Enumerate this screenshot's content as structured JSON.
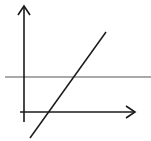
{
  "diagram": {
    "title": "",
    "colors": {
      "background": "#ffffff",
      "axes": "#1a1a1a",
      "horizontal_line": "#555555",
      "diagonal_line": "#1a1a1a"
    },
    "elements": {
      "y_axis": {
        "x": 24,
        "y1": 122,
        "y2": 6,
        "arrow": "up"
      },
      "x_axis": {
        "y": 112,
        "x1": 20,
        "x2": 135,
        "arrow": "right"
      },
      "horizontal_line": {
        "y": 77,
        "x1": 5,
        "x2": 151
      },
      "diagonal_line": {
        "x1": 30,
        "y1": 138,
        "x2": 106,
        "y2": 32
      }
    }
  }
}
